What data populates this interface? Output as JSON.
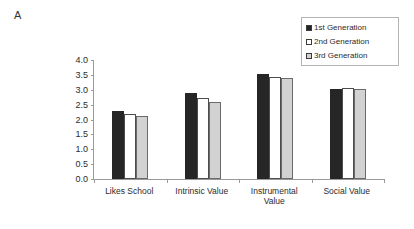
{
  "panel": {
    "label": "A"
  },
  "legend": {
    "position": "top-right",
    "items": [
      {
        "label": "1st Generation",
        "swatch": "legend-swatch-black",
        "color": "#262626"
      },
      {
        "label": "2nd Generation",
        "swatch": "legend-swatch-white",
        "color": "#ffffff"
      },
      {
        "label": "3rd Generation",
        "swatch": "legend-swatch-gray",
        "color": "#d2d2d2"
      }
    ]
  },
  "axis": {
    "y_ticks": [
      "4.0",
      "3.5",
      "3.0",
      "2.5",
      "2.0",
      "1.5",
      "1.0",
      "0.5",
      "0.0"
    ]
  },
  "chart_data": {
    "type": "bar",
    "title": "",
    "xlabel": "",
    "ylabel": "",
    "ylim": [
      0,
      4
    ],
    "ytick_interval": 0.5,
    "grid": false,
    "legend_position": "top-right",
    "categories": [
      "Likes School",
      "Intrinsic Value",
      "Instrumental Value",
      "Social Value"
    ],
    "category_lines": [
      [
        "Likes School"
      ],
      [
        "Intrinsic Value"
      ],
      [
        "Instrumental",
        "Value"
      ],
      [
        "Social Value"
      ]
    ],
    "series": [
      {
        "name": "1st Generation",
        "color": "#262626",
        "values": [
          2.3,
          2.89,
          3.52,
          3.01
        ]
      },
      {
        "name": "2nd Generation",
        "color": "#ffffff",
        "values": [
          2.17,
          2.72,
          3.44,
          3.05
        ]
      },
      {
        "name": "3rd Generation",
        "color": "#d2d2d2",
        "values": [
          2.12,
          2.59,
          3.4,
          3.04
        ]
      }
    ]
  }
}
